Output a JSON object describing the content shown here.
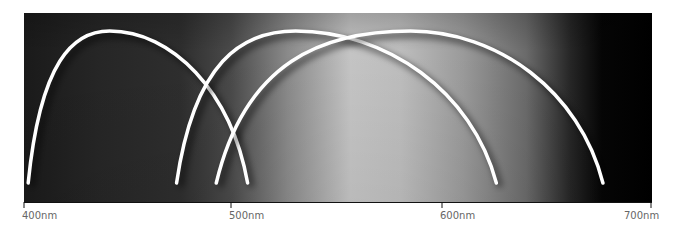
{
  "chart_data": {
    "type": "line",
    "title": "",
    "xlabel": "",
    "ylabel": "",
    "xlim": [
      400,
      700
    ],
    "x_unit": "nm",
    "x_ticks": [
      400,
      500,
      600,
      700
    ],
    "x_tick_labels": [
      "400nm",
      "500nm",
      "600nm",
      "700nm"
    ],
    "grid": false,
    "legend": null,
    "background": "grayscale gradient (dark at 400nm, brightest near 560nm, black past 670nm)",
    "series": [
      {
        "name": "curve-1",
        "start_nm": 402,
        "peak_nm": 441,
        "end_nm": 507,
        "color": "#ffffff"
      },
      {
        "name": "curve-2",
        "start_nm": 473,
        "peak_nm": 530,
        "end_nm": 626,
        "color": "#ffffff"
      },
      {
        "name": "curve-3",
        "start_nm": 492,
        "peak_nm": 585,
        "end_nm": 677,
        "color": "#ffffff"
      }
    ]
  },
  "axis": {
    "labels": [
      "400nm",
      "500nm",
      "600nm",
      "700nm"
    ]
  }
}
